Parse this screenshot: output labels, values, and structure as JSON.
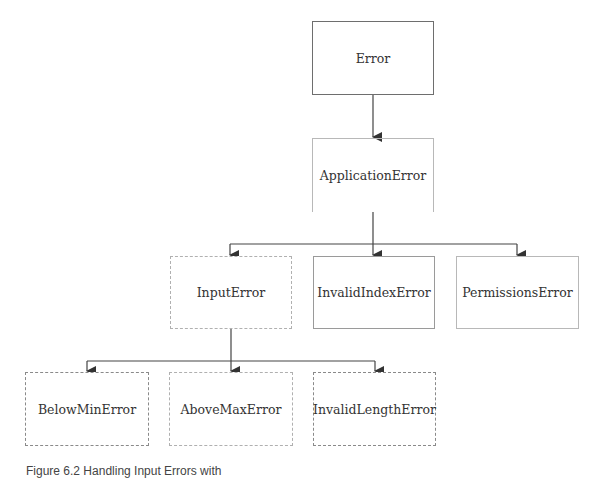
{
  "diagram": {
    "type": "class-hierarchy",
    "nodes": [
      {
        "id": "error",
        "label": "Error",
        "style": "solid"
      },
      {
        "id": "application-error",
        "label": "ApplicationError",
        "style": "solid-open-bottom"
      },
      {
        "id": "input-error",
        "label": "InputError",
        "style": "dashed"
      },
      {
        "id": "invalid-index-error",
        "label": "InvalidIndexError",
        "style": "solid"
      },
      {
        "id": "permissions-error",
        "label": "PermissionsError",
        "style": "solid-light"
      },
      {
        "id": "below-min-error",
        "label": "BelowMinError",
        "style": "dashed"
      },
      {
        "id": "above-max-error",
        "label": "AboveMaxError",
        "style": "dashed"
      },
      {
        "id": "invalid-length-error",
        "label": "InvalidLengthError",
        "style": "dashed"
      }
    ],
    "edges": [
      {
        "from": "error",
        "to": "application-error"
      },
      {
        "from": "application-error",
        "to": "input-error"
      },
      {
        "from": "application-error",
        "to": "invalid-index-error"
      },
      {
        "from": "application-error",
        "to": "permissions-error"
      },
      {
        "from": "input-error",
        "to": "below-min-error"
      },
      {
        "from": "input-error",
        "to": "above-max-error"
      },
      {
        "from": "input-error",
        "to": "invalid-length-error"
      }
    ],
    "caption": "Figure 6.2   Handling Input Errors with"
  }
}
